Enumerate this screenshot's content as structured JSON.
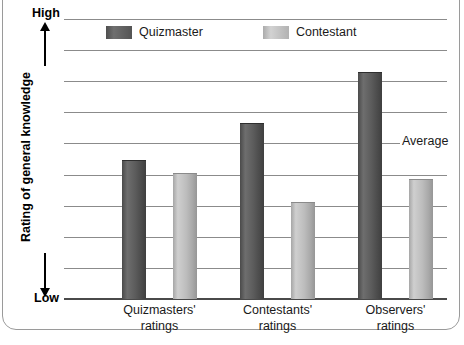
{
  "chart_data": {
    "type": "bar",
    "title": "",
    "subtitle": "",
    "xlabel": "",
    "ylabel": "Rating of general knowledge",
    "y_axis_high_label": "High",
    "y_axis_low_label": "Low",
    "ylim": [
      0,
      9
    ],
    "y_tick_count": 9,
    "grid": true,
    "legend_position": "top-center",
    "categories": [
      "Quizmasters' ratings",
      "Contestants' ratings",
      "Observers' ratings"
    ],
    "category_lines": [
      [
        "Quizmasters'",
        "ratings"
      ],
      [
        "Contestants'",
        "ratings"
      ],
      [
        "Observers'",
        "ratings"
      ]
    ],
    "series": [
      {
        "name": "Quizmaster",
        "color": "#5c5c5c",
        "values": [
          4.43,
          5.63,
          7.26
        ]
      },
      {
        "name": "Contestant",
        "color": "#bdbdbd",
        "values": [
          4.03,
          3.09,
          3.83
        ]
      }
    ],
    "annotations": [
      {
        "text": "Average",
        "y_value": 4.49,
        "position": "right"
      }
    ]
  },
  "legend": {
    "items": [
      {
        "label": "Quizmaster",
        "swatch": "dark-swatch"
      },
      {
        "label": "Contestant",
        "swatch": "light-swatch"
      }
    ]
  },
  "colors": {
    "bar_dark": "#5c5c5c",
    "bar_light": "#bdbdbd",
    "gridline": "#8b8b8b",
    "axis": "#4a4a4a",
    "text": "#1a1a1a",
    "frame": "#9a9a9a",
    "background": "#ffffff"
  }
}
